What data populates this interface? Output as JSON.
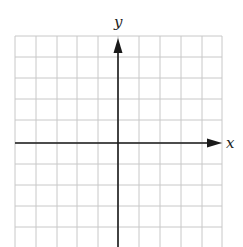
{
  "diagram": {
    "type": "cartesian-coordinate-grid",
    "x_axis_label": "x",
    "y_axis_label": "y",
    "grid": {
      "columns": 10,
      "rows_visible": 10,
      "left": 15,
      "right": 222,
      "top": 36,
      "bottom": 247,
      "vertical_lines_x": [
        15,
        36,
        57,
        77,
        98,
        118,
        139,
        160,
        181,
        202,
        222
      ],
      "horizontal_lines_y": [
        36,
        57,
        78,
        99,
        120,
        143,
        164,
        185,
        206,
        227
      ],
      "line_color": "#c8c8c8"
    },
    "origin": {
      "x": 118,
      "y": 143
    },
    "axis_color": "#1a1a1a",
    "x_axis": {
      "from_x": 15,
      "to_x": 222,
      "y": 143,
      "arrow_at": "right"
    },
    "y_axis": {
      "x": 118,
      "from_y": 247,
      "to_y": 36,
      "arrow_at": "top"
    }
  }
}
